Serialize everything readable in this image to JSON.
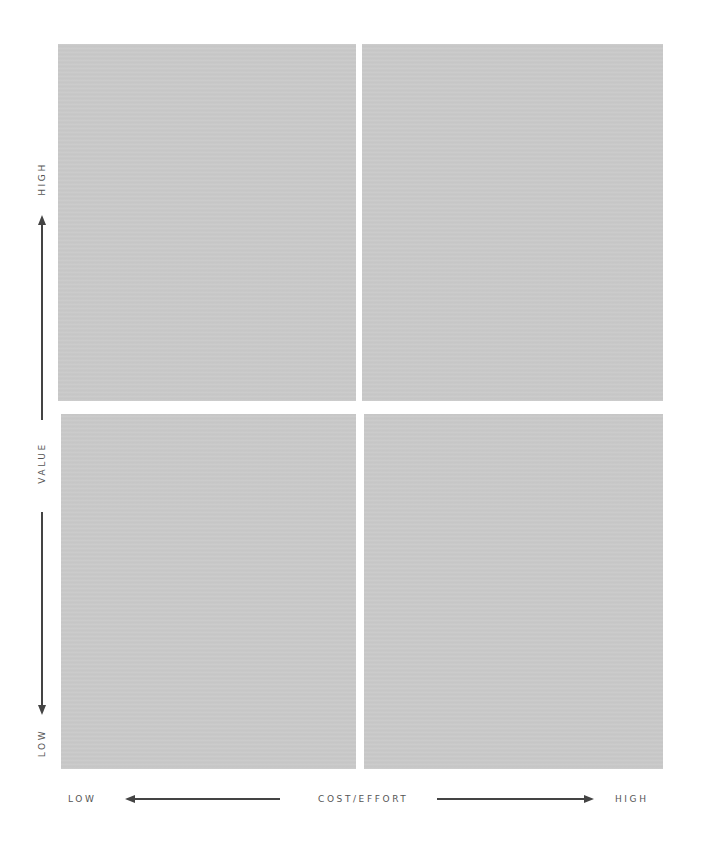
{
  "diagram": {
    "type": "2x2 matrix",
    "quadrant_fill": "#c9c9c9",
    "quadrants": [
      {
        "position": "top-left",
        "label": ""
      },
      {
        "position": "top-right",
        "label": ""
      },
      {
        "position": "bottom-left",
        "label": ""
      },
      {
        "position": "bottom-right",
        "label": ""
      }
    ]
  },
  "y_axis": {
    "title": "VALUE",
    "high_label": "HIGH",
    "low_label": "LOW"
  },
  "x_axis": {
    "title": "COST/EFFORT",
    "low_label": "LOW",
    "high_label": "HIGH"
  },
  "colors": {
    "axis_text": "#555555",
    "arrow": "#444444",
    "background": "#ffffff"
  }
}
